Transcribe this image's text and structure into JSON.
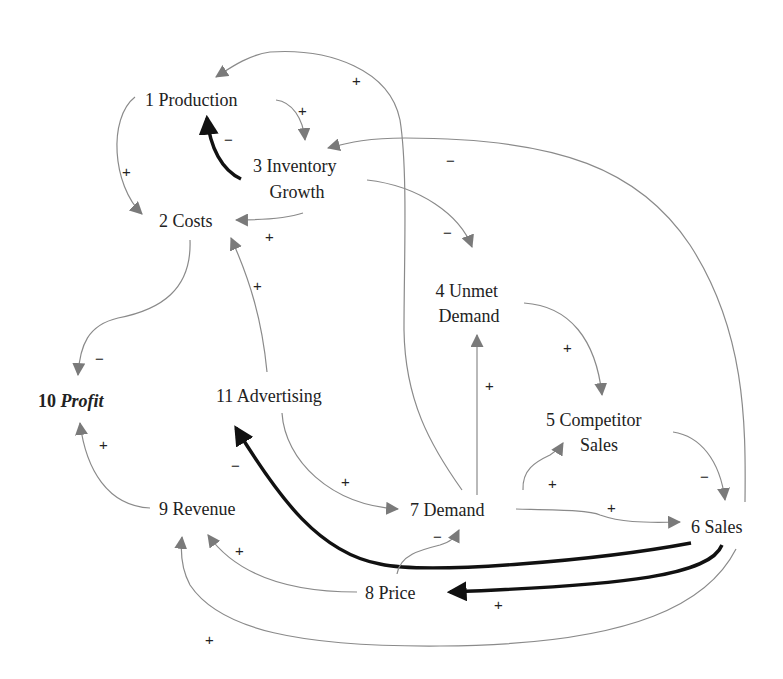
{
  "diagram": {
    "type": "causal-loop-diagram",
    "nodes": [
      {
        "id": "1",
        "label": "1 Production"
      },
      {
        "id": "2",
        "label": "2 Costs"
      },
      {
        "id": "3",
        "label_line1": "3 Inventory",
        "label_line2": "Growth"
      },
      {
        "id": "4",
        "label_line1": "4 Unmet",
        "label_line2": "Demand"
      },
      {
        "id": "5",
        "label_line1": "5 Competitor",
        "label_line2": "Sales"
      },
      {
        "id": "6",
        "label": "6 Sales"
      },
      {
        "id": "7",
        "label": "7 Demand"
      },
      {
        "id": "8",
        "label": "8 Price"
      },
      {
        "id": "9",
        "label": "9 Revenue"
      },
      {
        "id": "10",
        "label_num": "10 ",
        "label_italic": "Profit"
      },
      {
        "id": "11",
        "label": "11 Advertising"
      }
    ],
    "links": [
      {
        "from": "1",
        "to": "3",
        "polarity": "+",
        "emphasis": false
      },
      {
        "from": "1",
        "to": "2",
        "polarity": "+",
        "emphasis": false
      },
      {
        "from": "3",
        "to": "1",
        "polarity": "−",
        "emphasis": true
      },
      {
        "from": "3",
        "to": "2",
        "polarity": "+",
        "emphasis": false
      },
      {
        "from": "3",
        "to": "4",
        "polarity": "−",
        "emphasis": false
      },
      {
        "from": "6",
        "to": "3",
        "polarity": "−",
        "emphasis": false
      },
      {
        "from": "7",
        "to": "1",
        "polarity": "+",
        "emphasis": false
      },
      {
        "from": "2",
        "to": "10",
        "polarity": "−",
        "emphasis": false
      },
      {
        "from": "11",
        "to": "2",
        "polarity": "+",
        "emphasis": false
      },
      {
        "from": "4",
        "to": "5",
        "polarity": "+",
        "emphasis": false
      },
      {
        "from": "7",
        "to": "4",
        "polarity": "+",
        "emphasis": false
      },
      {
        "from": "7",
        "to": "5",
        "polarity": "+",
        "emphasis": false
      },
      {
        "from": "5",
        "to": "6",
        "polarity": "−",
        "emphasis": false
      },
      {
        "from": "7",
        "to": "6",
        "polarity": "+",
        "emphasis": false
      },
      {
        "from": "11",
        "to": "7",
        "polarity": "+",
        "emphasis": false
      },
      {
        "from": "6",
        "to": "11",
        "polarity": "−",
        "emphasis": true
      },
      {
        "from": "6",
        "to": "8",
        "polarity": "+",
        "emphasis": true
      },
      {
        "from": "8",
        "to": "7",
        "polarity": "−",
        "emphasis": false
      },
      {
        "from": "8",
        "to": "9",
        "polarity": "+",
        "emphasis": false
      },
      {
        "from": "6",
        "to": "9",
        "polarity": "+",
        "emphasis": false
      },
      {
        "from": "9",
        "to": "10",
        "polarity": "+",
        "emphasis": false
      }
    ],
    "colors": {
      "link": "#8a8a8a",
      "emphasis_link": "#111111",
      "text": "#222222",
      "background": "#ffffff"
    }
  }
}
